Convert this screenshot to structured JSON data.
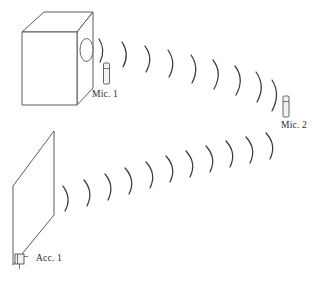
{
  "diagram": {
    "background_color": "#ffffff",
    "line_color": "#4a4a4a",
    "wave_color": "#3d3d3d",
    "labels": {
      "mic_1": "Mic. 1",
      "mic_2": "Mic. 2",
      "acc_1": "Acc. 1"
    },
    "objects": [
      {
        "name": "speaker-enclosure-box",
        "type": "3d-box",
        "description": "Rectangular box drawn in oblique projection with front face, top face and right side face"
      },
      {
        "name": "speaker-port-ellipse",
        "type": "ellipse",
        "description": "Oval opening on the right side face of the box"
      },
      {
        "name": "panel-parallelogram",
        "type": "parallelogram",
        "description": "Flat panel drawn in perspective at lower left"
      },
      {
        "name": "microphone-1",
        "type": "microphone",
        "description": "Upright cylindrical microphone in front of box port"
      },
      {
        "name": "microphone-2",
        "type": "microphone",
        "description": "Upright cylindrical microphone at right receiving both wave fronts"
      },
      {
        "name": "accelerometer-1",
        "type": "accelerometer",
        "description": "Small block sensor mounted on lower left edge of the panel"
      }
    ],
    "wave_groups": [
      {
        "name": "upper-wave-train",
        "from": "speaker-port-ellipse",
        "to": "microphone-2",
        "arc_count": 9
      },
      {
        "name": "lower-wave-train",
        "from": "panel-parallelogram",
        "to": "microphone-2",
        "arc_count": 11
      }
    ]
  }
}
